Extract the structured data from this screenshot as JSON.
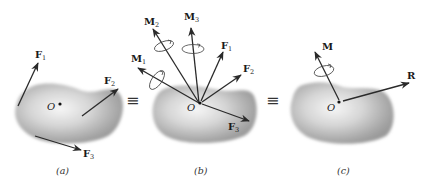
{
  "figure": {
    "panels": [
      {
        "id": "a",
        "caption": "(a)",
        "origin_label": "O",
        "vectors": [
          {
            "name": "F",
            "sub": "1",
            "kind": "force"
          },
          {
            "name": "F",
            "sub": "2",
            "kind": "force"
          },
          {
            "name": "F",
            "sub": "3",
            "kind": "force"
          }
        ]
      },
      {
        "id": "b",
        "caption": "(b)",
        "origin_label": "O",
        "vectors": [
          {
            "name": "M",
            "sub": "1",
            "kind": "moment"
          },
          {
            "name": "M",
            "sub": "2",
            "kind": "moment"
          },
          {
            "name": "M",
            "sub": "3",
            "kind": "moment"
          },
          {
            "name": "F",
            "sub": "1",
            "kind": "force"
          },
          {
            "name": "F",
            "sub": "2",
            "kind": "force"
          },
          {
            "name": "F",
            "sub": "3",
            "kind": "force"
          }
        ]
      },
      {
        "id": "c",
        "caption": "(c)",
        "origin_label": "O",
        "vectors": [
          {
            "name": "M",
            "sub": "",
            "kind": "moment"
          },
          {
            "name": "R",
            "sub": "",
            "kind": "force"
          }
        ]
      }
    ],
    "equivalence_symbol": "≡",
    "colors": {
      "body_shade": "#9a9a9a",
      "body_highlight": "#f4f4f4",
      "arrow": "#2a2a2a",
      "text": "#1a1a1a"
    }
  }
}
